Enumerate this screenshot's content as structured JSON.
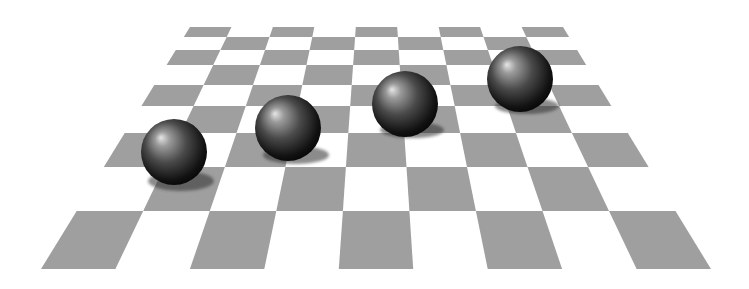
{
  "scene": {
    "description": "Rendered 3D checkerboard floor in perspective with four dark glossy spheres casting shadows",
    "width": 749,
    "height": 289,
    "background_color": "#ffffff"
  },
  "board": {
    "columns": 9,
    "rows": 9,
    "dark_color": "#9f9f9f",
    "light_color": "#ffffff",
    "row_boundaries_y": [
      27,
      37,
      50,
      65,
      85,
      106,
      133,
      167,
      211,
      269
    ],
    "top_edge": {
      "y": 27,
      "x_left": 190,
      "x_right": 563
    },
    "bottom_edge": {
      "y": 269,
      "x_left": 41,
      "x_right": 711
    },
    "dark_on_even_parity": true
  },
  "spheres": [
    {
      "id": "sphere-1",
      "cx": 174,
      "cy": 152,
      "r": 33,
      "shadow": {
        "cx": 181,
        "cy": 181,
        "rx": 33,
        "ry": 10
      }
    },
    {
      "id": "sphere-2",
      "cx": 288,
      "cy": 128,
      "r": 33,
      "shadow": {
        "cx": 296,
        "cy": 155,
        "rx": 33,
        "ry": 9
      }
    },
    {
      "id": "sphere-3",
      "cx": 405,
      "cy": 104,
      "r": 33,
      "shadow": {
        "cx": 412,
        "cy": 130,
        "rx": 32,
        "ry": 8
      }
    },
    {
      "id": "sphere-4",
      "cx": 520,
      "cy": 79,
      "r": 33,
      "shadow": {
        "cx": 527,
        "cy": 106,
        "rx": 32,
        "ry": 8
      }
    }
  ],
  "sphere_style": {
    "highlight_color": "#e6e6e6",
    "mid_color": "#5a5a5a",
    "dark_color": "#0a0a0a",
    "highlight_offset": {
      "fx": "30%",
      "fy": "28%"
    },
    "shadow_color": "#2e2e2e",
    "shadow_opacity": 0.55
  },
  "caption": "Four spheres on a checkerboard"
}
